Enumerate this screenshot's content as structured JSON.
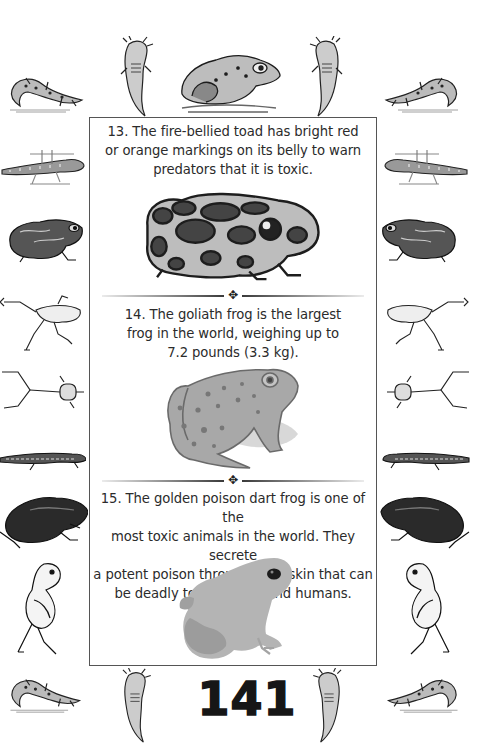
{
  "page": {
    "number": "141",
    "facts": [
      {
        "id": 13,
        "text": "13. The fire-bellied toad has bright red or orange markings on its belly to warn predators that it is toxic.",
        "lines": [
          "13. The fire-bellied toad has bright red",
          "or orange markings on its belly to warn",
          "predators that it is toxic."
        ],
        "illustration": "spotted-toad-illustration"
      },
      {
        "id": 14,
        "text": "14. The goliath frog is the largest frog in the world, weighing up to 7.2 pounds (3.3 kg).",
        "lines": [
          "14. The goliath frog is the largest",
          "frog in the world, weighing up to",
          "7.2 pounds (3.3 kg)."
        ],
        "illustration": "goliath-frog-illustration"
      },
      {
        "id": 15,
        "text": "15. The golden poison dart frog is one of the most toxic animals in the world. They secrete a potent poison through their skin that can be deadly to predators and humans.",
        "lines": [
          "15. The golden poison dart frog is one of the",
          "most toxic animals in the world. They secrete",
          "a potent poison through their skin that can",
          "be deadly to predators and humans."
        ],
        "illustration": "poison-dart-frog-illustration"
      }
    ],
    "divider_ornament": "✥"
  },
  "border_decorations": {
    "top": [
      "salamander",
      "axolotl",
      "bullfrog",
      "axolotl",
      "salamander"
    ],
    "left": [
      "newt",
      "toad",
      "frog-leaping",
      "frog-skeleton",
      "lizard-newt",
      "dark-toad",
      "sitting-frog"
    ],
    "right": [
      "newt",
      "toad",
      "frog-leaping",
      "frog-skeleton",
      "lizard-newt",
      "dark-toad",
      "sitting-frog"
    ],
    "bottom": [
      "salamander",
      "axolotl",
      "page-number",
      "axolotl",
      "salamander"
    ]
  },
  "colors": {
    "text": "#2b2b2b",
    "frame_border": "#555555",
    "page_number": "#161616",
    "background": "#ffffff"
  }
}
